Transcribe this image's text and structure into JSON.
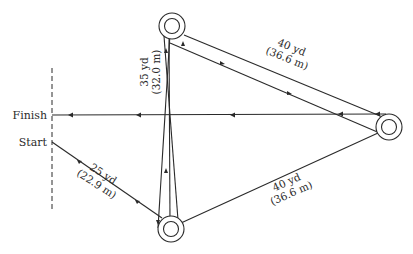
{
  "diagram": {
    "type": "running course / cone drill",
    "labels": {
      "finish": "Finish",
      "start": "Start"
    },
    "segments": [
      {
        "id": "start-to-bottom",
        "yd": "25 yd",
        "m": "(22.9 m)"
      },
      {
        "id": "bottom-to-top",
        "yd": "35 yd",
        "m": "(32.0 m)"
      },
      {
        "id": "top-to-right",
        "yd": "40 yd",
        "m": "(36.6 m)"
      },
      {
        "id": "right-to-bottom",
        "yd": "40 yd",
        "m": "(36.6 m)"
      }
    ],
    "cones": [
      "top-cone",
      "right-cone",
      "bottom-cone"
    ],
    "colors": {
      "line": "#2a2a2a",
      "background": "#ffffff"
    }
  }
}
